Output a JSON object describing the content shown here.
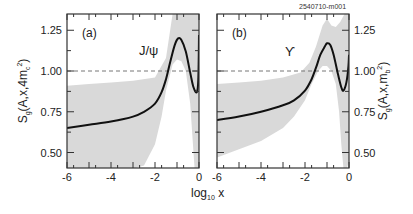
{
  "figure_id": "2540710-m001",
  "shared_xlabel": {
    "base": "log",
    "sub": "10",
    "var": " x"
  },
  "chart_data": [
    {
      "type": "line",
      "panel": "(a)",
      "annotation": "J/ψ",
      "title": "",
      "xlabel": "log10 x",
      "ylabel": "S_g(A,x,4m_c^2)",
      "ylabel_parts": {
        "main": "S",
        "sub": "g",
        "args": "(A,x,4m",
        "sub2": "c",
        "sup": "2",
        "close": ")"
      },
      "xlim": [
        -6,
        0
      ],
      "ylim": [
        0.4,
        1.35
      ],
      "xticks": [
        "-6",
        "-4",
        "-2",
        "0"
      ],
      "yticks": [
        "0.50",
        "0.75",
        "1.00",
        "1.25"
      ],
      "reference_line": {
        "y": 1.0,
        "style": "dashed"
      },
      "series": [
        {
          "name": "central",
          "x": [
            -6,
            -5,
            -4,
            -3,
            -2.5,
            -2,
            -1.7,
            -1.5,
            -1.3,
            -1.1,
            -0.95,
            -0.8,
            -0.6,
            -0.4,
            -0.25,
            -0.1,
            -0.03,
            0
          ],
          "y": [
            0.65,
            0.67,
            0.69,
            0.72,
            0.75,
            0.8,
            0.87,
            0.95,
            1.06,
            1.16,
            1.2,
            1.19,
            1.12,
            0.99,
            0.9,
            0.87,
            0.95,
            1.22
          ]
        },
        {
          "name": "band_upper",
          "x": [
            -6,
            -5,
            -4,
            -3,
            -2,
            -1.5,
            -1.2,
            -0.9,
            -0.7,
            -0.5,
            -0.3,
            -0.15,
            0
          ],
          "y": [
            0.91,
            0.92,
            0.93,
            0.94,
            0.96,
            1.08,
            1.35,
            1.35,
            1.35,
            1.35,
            1.35,
            1.35,
            1.35
          ]
        },
        {
          "name": "band_lower",
          "x": [
            -6,
            -4,
            -3,
            -2.5,
            -2,
            -1.7,
            -1.5,
            -1.2,
            -1.0,
            -0.8,
            -0.6,
            -0.4,
            -0.3,
            -0.2,
            0
          ],
          "y": [
            0.4,
            0.4,
            0.4,
            0.42,
            0.55,
            0.72,
            0.88,
            1.04,
            1.07,
            1.06,
            1.0,
            0.8,
            0.6,
            0.4,
            0.4
          ]
        }
      ]
    },
    {
      "type": "line",
      "panel": "(b)",
      "annotation": "ϒ",
      "title": "",
      "xlabel": "log10 x",
      "ylabel": "S_g(A,x,m_b^2)",
      "ylabel_parts": {
        "main": "S",
        "sub": "g",
        "args": "(A,x,m",
        "sub2": "b",
        "sup": "2",
        "close": ")"
      },
      "xlim": [
        -6,
        0
      ],
      "ylim": [
        0.4,
        1.35
      ],
      "xticks": [
        "-6",
        "-4",
        "-2",
        "0"
      ],
      "yticks": [
        "0.50",
        "0.75",
        "1.00",
        "1.25"
      ],
      "reference_line": {
        "y": 1.0,
        "style": "dashed"
      },
      "series": [
        {
          "name": "central",
          "x": [
            -6,
            -5,
            -4,
            -3,
            -2.5,
            -2,
            -1.7,
            -1.5,
            -1.3,
            -1.1,
            -1.0,
            -0.85,
            -0.7,
            -0.5,
            -0.35,
            -0.25,
            -0.12,
            -0.03,
            0
          ],
          "y": [
            0.7,
            0.72,
            0.75,
            0.79,
            0.82,
            0.88,
            0.95,
            1.02,
            1.1,
            1.15,
            1.17,
            1.16,
            1.1,
            0.98,
            0.9,
            0.88,
            0.93,
            1.02,
            1.1
          ]
        },
        {
          "name": "band_upper",
          "x": [
            -6,
            -5,
            -4,
            -3,
            -2.2,
            -1.8,
            -1.5,
            -1.2,
            -1.0,
            -0.8,
            -0.6,
            -0.4,
            -0.2,
            0
          ],
          "y": [
            0.92,
            0.93,
            0.94,
            0.96,
            0.99,
            1.05,
            1.15,
            1.28,
            1.32,
            1.28,
            1.27,
            1.3,
            1.35,
            1.35
          ]
        },
        {
          "name": "band_lower",
          "x": [
            -6,
            -5,
            -4,
            -3,
            -2.5,
            -2,
            -1.7,
            -1.4,
            -1.2,
            -1.0,
            -0.8,
            -0.6,
            -0.45,
            -0.35,
            -0.25,
            -0.1,
            0
          ],
          "y": [
            0.47,
            0.52,
            0.57,
            0.65,
            0.72,
            0.82,
            0.92,
            1.0,
            1.03,
            1.03,
            1.0,
            0.92,
            0.75,
            0.55,
            0.4,
            0.4,
            0.45
          ]
        }
      ]
    }
  ]
}
